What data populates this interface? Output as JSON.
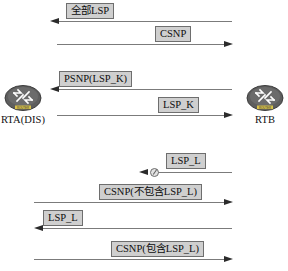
{
  "diagram": {
    "nodes": [
      {
        "id": "rta",
        "label": "RTA(DIS)",
        "icon": "router-icon",
        "icon_caption": "ROUTER"
      },
      {
        "id": "rtb",
        "label": "RTB",
        "icon": "router-icon",
        "icon_caption": "ROUTER"
      }
    ],
    "colors": {
      "line": "#7b7b7b",
      "arrow": "#2b2b2b",
      "label_fill": "#cfcfcf",
      "label_border": "#6e6e6e",
      "node_fill": "#5e5e5e",
      "background": "#ffffff"
    },
    "messages": [
      {
        "id": "msg-1",
        "label": "全部LSP",
        "direction": "left",
        "from": "rtb",
        "to": "rta",
        "dropped": false
      },
      {
        "id": "msg-2",
        "label": "CSNP",
        "direction": "right",
        "from": "rta",
        "to": "rtb",
        "dropped": false
      },
      {
        "id": "msg-3",
        "label": "PSNP(LSP_K)",
        "direction": "left",
        "from": "rtb",
        "to": "rta",
        "dropped": false
      },
      {
        "id": "msg-4",
        "label": "LSP_K",
        "direction": "right",
        "from": "rta",
        "to": "rtb",
        "dropped": false
      },
      {
        "id": "msg-5",
        "label": "LSP_L",
        "direction": "left",
        "from": "rtb",
        "to": "rta",
        "dropped": true
      },
      {
        "id": "msg-6",
        "label": "CSNP(不包含LSP_L)",
        "direction": "right",
        "from": "rta",
        "to": "rtb",
        "dropped": false
      },
      {
        "id": "msg-7",
        "label": "LSP_L",
        "direction": "left",
        "from": "rtb",
        "to": "rta",
        "dropped": false
      },
      {
        "id": "msg-8",
        "label": "CSNP(包含LSP_L)",
        "direction": "right",
        "from": "rta",
        "to": "rtb",
        "dropped": false
      }
    ]
  }
}
